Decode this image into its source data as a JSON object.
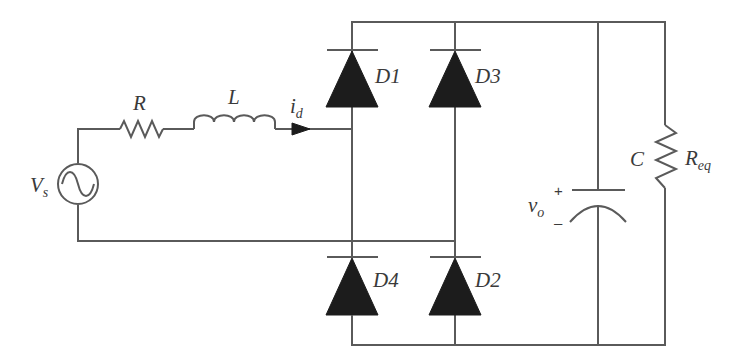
{
  "diagram": {
    "source": {
      "label": "V",
      "sub": "s",
      "icon": "ac-source-icon"
    },
    "resistor": {
      "label": "R"
    },
    "inductor": {
      "label": "L"
    },
    "current": {
      "label": "i",
      "sub": "d",
      "icon": "current-arrow-icon"
    },
    "diodes": [
      {
        "label": "D1"
      },
      {
        "label": "D3"
      },
      {
        "label": "D4"
      },
      {
        "label": "D2"
      }
    ],
    "capacitor": {
      "label": "C",
      "plus": "+",
      "minus": "–"
    },
    "output_voltage": {
      "label": "v",
      "sub": "o"
    },
    "load": {
      "label": "R",
      "sub": "eq"
    },
    "colors": {
      "wire": "#5a5a5a",
      "diode": "#1c1c1c",
      "text": "#3a3a3a",
      "background": "#ffffff"
    }
  }
}
